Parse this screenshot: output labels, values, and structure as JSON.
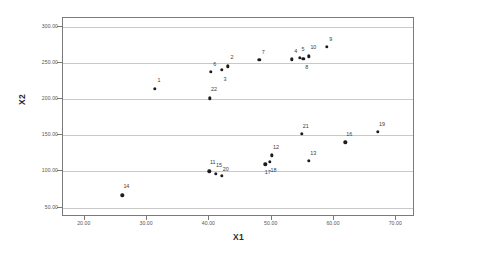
{
  "chart_data": {
    "type": "scatter",
    "title": "",
    "xlabel": "X1",
    "ylabel": "X2",
    "xlim": [
      16.5,
      73.0
    ],
    "ylim": [
      37.0,
      312.0
    ],
    "grid": "horizontal",
    "legend": "none",
    "xticks": [
      {
        "value": 20,
        "label": "20.00"
      },
      {
        "value": 30,
        "label": "30.00"
      },
      {
        "value": 40,
        "label": "40.00"
      },
      {
        "value": 50,
        "label": "50.00"
      },
      {
        "value": 60,
        "label": "60.00"
      },
      {
        "value": 70,
        "label": "70.00"
      }
    ],
    "yticks": [
      {
        "value": 300,
        "label": "300.00"
      },
      {
        "value": 250,
        "label": "250.00"
      },
      {
        "value": 200,
        "label": "200.00"
      },
      {
        "value": 150,
        "label": "150.00"
      },
      {
        "value": 100,
        "label": "100.00"
      },
      {
        "value": 50,
        "label": "50.00"
      }
    ],
    "marker_color": "#1c1c1c",
    "points": [
      {
        "label": "1",
        "x": 31.2,
        "y": 214,
        "lx": 1.2,
        "ly": 9
      },
      {
        "label": "2",
        "x": 43.0,
        "y": 245,
        "lx": 0.7,
        "ly": 9
      },
      {
        "label": "3",
        "x": 42.0,
        "y": 240,
        "lx": -0.1,
        "ly": -9
      },
      {
        "label": "4",
        "x": 53.2,
        "y": 255,
        "lx": 0.8,
        "ly": 8
      },
      {
        "label": "5",
        "x": 54.5,
        "y": 257,
        "lx": 0.1,
        "ly": 9
      },
      {
        "label": "6",
        "x": 40.2,
        "y": 238,
        "lx": 0.9,
        "ly": 8
      },
      {
        "label": "7",
        "x": 48.0,
        "y": 254,
        "lx": 0.9,
        "ly": 8
      },
      {
        "label": "8",
        "x": 55.1,
        "y": 256,
        "lx": 0.1,
        "ly": -8
      },
      {
        "label": "9",
        "x": 58.8,
        "y": 272,
        "lx": 1.0,
        "ly": 8
      },
      {
        "label": "10",
        "x": 56.0,
        "y": 259,
        "lx": 1.1,
        "ly": 9
      },
      {
        "label": "11",
        "x": 40.0,
        "y": 100,
        "lx": 0.1,
        "ly": 9
      },
      {
        "label": "12",
        "x": 50.0,
        "y": 122,
        "lx": 1.2,
        "ly": 8
      },
      {
        "label": "13",
        "x": 56.0,
        "y": 115,
        "lx": 1.0,
        "ly": 8
      },
      {
        "label": "14",
        "x": 26.0,
        "y": 67,
        "lx": 1.0,
        "ly": 9
      },
      {
        "label": "15",
        "x": 41.0,
        "y": 97,
        "lx": 0.1,
        "ly": 9
      },
      {
        "label": "16",
        "x": 61.8,
        "y": 140,
        "lx": 0.9,
        "ly": 8
      },
      {
        "label": "17",
        "x": 49.0,
        "y": 110,
        "lx": -1.0,
        "ly": -8
      },
      {
        "label": "18",
        "x": 49.7,
        "y": 113,
        "lx": 0.4,
        "ly": -8
      },
      {
        "label": "19",
        "x": 67.0,
        "y": 155,
        "lx": 1.1,
        "ly": 8
      },
      {
        "label": "20",
        "x": 42.0,
        "y": 94,
        "lx": 0.8,
        "ly": 7
      },
      {
        "label": "21",
        "x": 54.8,
        "y": 152,
        "lx": 1.0,
        "ly": 8
      },
      {
        "label": "22",
        "x": 40.1,
        "y": 201,
        "lx": 0.7,
        "ly": 9
      }
    ]
  }
}
